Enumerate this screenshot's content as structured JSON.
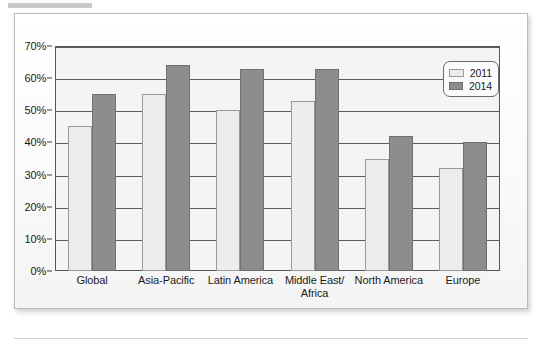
{
  "chart_data": {
    "type": "bar",
    "title": "",
    "subtitle": "",
    "xlabel": "",
    "ylabel": "",
    "ylim": [
      0,
      70
    ],
    "grid": true,
    "legend_position": "top-right-inside",
    "categories": [
      "Global",
      "Asia-Pacific",
      "Latin America",
      "Middle East/ Africa",
      "North America",
      "Europe"
    ],
    "category_lines": [
      [
        "Global"
      ],
      [
        "Asia-Pacific"
      ],
      [
        "Latin America"
      ],
      [
        "Middle East/",
        "Africa"
      ],
      [
        "North America"
      ],
      [
        "Europe"
      ]
    ],
    "series": [
      {
        "name": "2011",
        "color": "#ececec",
        "values": [
          45,
          55,
          50,
          53,
          35,
          32
        ]
      },
      {
        "name": "2014",
        "color": "#8d8d8d",
        "values": [
          55,
          64,
          63,
          63,
          42,
          40
        ]
      }
    ],
    "y_ticks": [
      0,
      10,
      20,
      30,
      40,
      50,
      60,
      70
    ],
    "y_tick_labels": [
      "0%",
      "10%",
      "20%",
      "30%",
      "40%",
      "50%",
      "60%",
      "70%"
    ]
  },
  "legend": {
    "entries": [
      {
        "label": "2011"
      },
      {
        "label": "2014"
      }
    ]
  },
  "colors": {
    "series_2011": "#ececec",
    "series_2014": "#8d8d8d",
    "axis": "#555555",
    "gridline": "#5d5d5d",
    "plot_background": "#f4f4f4",
    "panel_border": "#b9b9b9"
  }
}
